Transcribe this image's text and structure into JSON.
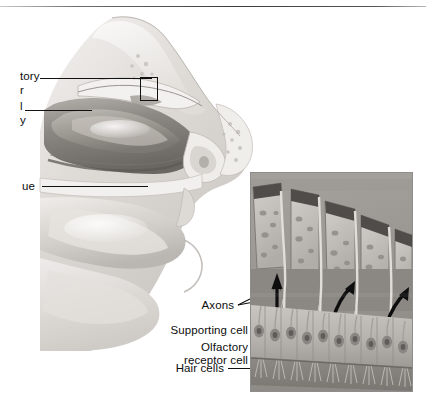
{
  "figure": {
    "style": "grayscale halftone anatomical illustration"
  },
  "colors": {
    "ink": "#0d0d0d",
    "rule": "#3c3c3c",
    "tissue_light": "#e2e0dd",
    "tissue_mid": "#b9b6b2",
    "tissue_dark": "#6f6c68",
    "bone_pale": "#f1efec",
    "inset_bg": "#9a9a9a",
    "inset_cell": "#c3c0bb",
    "inset_dark_cap": "#4a4744"
  },
  "left_labels": [
    {
      "id": "olfactory-bulb",
      "line1": "tory",
      "line2": "r",
      "note": "text clipped at left image edge"
    },
    {
      "id": "nasal-cavity",
      "line1": "l",
      "line2": "y",
      "note": "text clipped at left image edge"
    },
    {
      "id": "tongue",
      "line1": "ue",
      "line2": "",
      "note": "text clipped at left image edge"
    }
  ],
  "inset_labels": [
    {
      "id": "axons",
      "text": "Axons"
    },
    {
      "id": "supporting-cell",
      "text": "Supporting cell"
    },
    {
      "id": "olfactory-receptor-cell-line1",
      "text": "Olfactory"
    },
    {
      "id": "olfactory-receptor-cell-line2",
      "text": "receptor cell"
    },
    {
      "id": "hair-cells",
      "text": "Hair cells"
    }
  ],
  "callout": {
    "id": "olfactory-epithelium-callout",
    "description": "black rectangle marking olfactory epithelium region on roof of nasal cavity"
  },
  "inset": {
    "description": "magnified olfactory epithelium: supporting cells, olfactory receptor cells with nuclei, hair cells (cilia) and axons projecting upward",
    "arrow_count": 3,
    "arrow_direction": "upward toward olfactory bulb"
  }
}
